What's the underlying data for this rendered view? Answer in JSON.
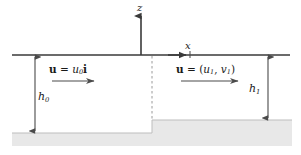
{
  "figure": {
    "background_color": "#ffffff",
    "line_color": "#3a3a3a",
    "bed_fill_color": "#e8e8e8",
    "dashed_color": "#9a9a9a",
    "text_color": "#1a1a1a"
  },
  "axes": {
    "z_label": "z",
    "x_label": "x",
    "z_axis_name": "vertical-axis",
    "x_axis_name": "horizontal-axis"
  },
  "labels": {
    "velocity_left": {
      "bold_u": "u",
      "equals": " = ",
      "value": "u",
      "subscript": "0",
      "unit_vector": "i",
      "plain": "u = u0i"
    },
    "velocity_right": {
      "bold_u": "u",
      "equals": " = ",
      "open": "(",
      "u_symbol": "u",
      "u_subscript": "1",
      "comma": ", ",
      "v_symbol": "v",
      "v_subscript": "1",
      "close": ")",
      "plain": "u = (u1, v1)"
    },
    "depth_left": {
      "symbol": "h",
      "subscript": "0",
      "plain": "h0"
    },
    "depth_right": {
      "symbol": "h",
      "subscript": "1",
      "plain": "h1"
    }
  },
  "geometry": {
    "free_surface_y": 55,
    "free_surface_x_start": 12,
    "free_surface_x_end": 290,
    "step_x": 152,
    "bed_left_y": 133,
    "bed_right_y": 120,
    "h0_arrow_x": 35,
    "h1_arrow_x": 268,
    "z_axis_x": 141,
    "z_axis_top": 14,
    "x_axis_arrow_x": 190
  }
}
